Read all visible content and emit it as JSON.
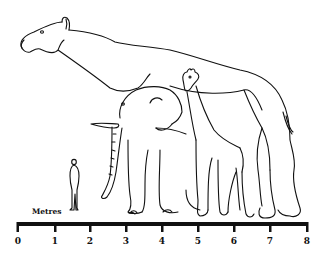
{
  "diagram": {
    "type": "size-comparison",
    "subjects": [
      {
        "name": "Indricotherium (Paraceratherium)",
        "approx_height_m": 5.2,
        "approx_length_m": 7.7
      },
      {
        "name": "African elephant",
        "approx_height_m": 3.5
      },
      {
        "name": "Giraffe",
        "approx_height_m": 4.4
      },
      {
        "name": "Human",
        "approx_height_m": 1.8
      }
    ],
    "stroke_color": "#111111",
    "background": "#ffffff"
  },
  "scale": {
    "title": "Metres",
    "unit": "m",
    "ticks": [
      {
        "label": "0",
        "x": 18
      },
      {
        "label": "1",
        "x": 55
      },
      {
        "label": "2",
        "x": 90
      },
      {
        "label": "3",
        "x": 126
      },
      {
        "label": "4",
        "x": 162
      },
      {
        "label": "5",
        "x": 198
      },
      {
        "label": "6",
        "x": 234
      },
      {
        "label": "7",
        "x": 270
      },
      {
        "label": "8",
        "x": 307
      }
    ]
  }
}
